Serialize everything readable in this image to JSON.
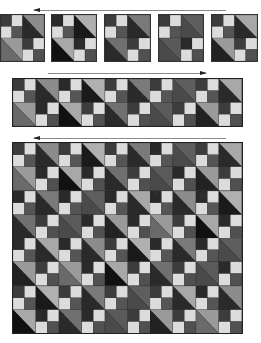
{
  "figure": {
    "arrows": [
      {
        "name": "arrow-row1",
        "direction": "left",
        "x": 34,
        "y": 10,
        "width": 192
      },
      {
        "name": "arrow-strip",
        "direction": "right",
        "x": 48,
        "y": 73,
        "width": 158
      },
      {
        "name": "arrow-quilt",
        "direction": "left",
        "x": 34,
        "y": 138,
        "width": 192
      }
    ],
    "single_blocks": [
      {
        "x": 0,
        "y": 14,
        "w": 45,
        "h": 48,
        "hst": [
          "#2a2a2a",
          "#8c8c8c"
        ],
        "hst2": [
          "#6a6a6a",
          "#9a9a9a"
        ],
        "print": "lattice"
      },
      {
        "x": 51,
        "y": 14,
        "w": 46,
        "h": 48,
        "hst": [
          "#1a1a1a",
          "#b0b0b0"
        ],
        "hst2": [
          "#111111",
          "#a8a8a8"
        ],
        "print": "solid"
      },
      {
        "x": 104,
        "y": 14,
        "w": 47,
        "h": 48,
        "hst": [
          "#2a2a2a",
          "#7a7a7a"
        ],
        "hst2": [
          "#2a2a2a",
          "#707070"
        ],
        "print": "lattice"
      },
      {
        "x": 158,
        "y": 14,
        "w": 46,
        "h": 48,
        "hst": [
          "#4a4a4a",
          "#5e5e5e"
        ],
        "hst2": [
          "#4a4a4a",
          "#5a5a5a"
        ],
        "print": "solid"
      },
      {
        "x": 211,
        "y": 14,
        "w": 47,
        "h": 48,
        "hst": [
          "#2a2a2a",
          "#a8a8a8"
        ],
        "hst2": [
          "#222222",
          "#9a9a9a"
        ],
        "print": "lattice"
      }
    ],
    "strip": {
      "x": 12,
      "y": 78,
      "w": 231,
      "h": 49,
      "blocks": 5
    },
    "quilt": {
      "x": 12,
      "y": 142,
      "w": 231,
      "h": 192,
      "cols": 5,
      "rows": 4
    },
    "colors": {
      "light": "#dcdcdc",
      "medium": "#6e6e6e",
      "dark": "#2a2a2a",
      "black": "#111111",
      "grey": "#8e8e8e",
      "lightgrey": "#b4b4b4",
      "arrow": "#8a8a8a",
      "outline": "#222222"
    }
  }
}
